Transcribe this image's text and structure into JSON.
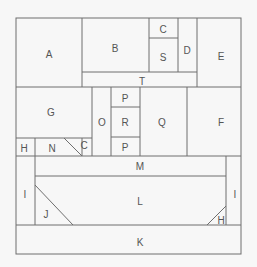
{
  "diagram": {
    "title": "",
    "labels": {
      "A": "A",
      "B": "B",
      "C_top": "C",
      "S": "S",
      "D": "D",
      "E": "E",
      "T": "T",
      "G": "G",
      "O": "O",
      "P_top": "P",
      "R": "R",
      "P_bottom": "P",
      "Q": "Q",
      "F": "F",
      "H_left": "H",
      "N": "N",
      "C_small": "C",
      "M": "M",
      "I_left": "I",
      "I_right": "I",
      "L": "L",
      "J": "J",
      "H_right": "H",
      "K": "K"
    }
  }
}
